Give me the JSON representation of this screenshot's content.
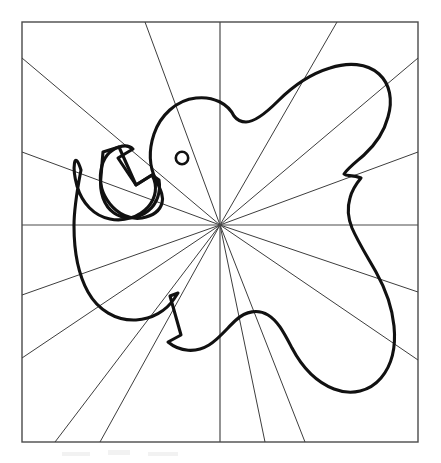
{
  "figure": {
    "medium": "black ink line drawing on white paper",
    "background_color": "#ffffff",
    "outline_color": "#111111",
    "line_color": "#3d3d3d",
    "frame_color": "#4a4a4a",
    "canvas": {
      "width": 441,
      "height": 463
    }
  },
  "frame": {
    "name": "bounding-square",
    "x": 22,
    "y": 22,
    "width": 396,
    "height": 420,
    "stroke_width": 1.4
  },
  "radial_center": {
    "x": 220,
    "y": 225
  },
  "axes": [
    {
      "name": "vertical-axis",
      "x1": 220,
      "y1": 22,
      "x2": 220,
      "y2": 442
    },
    {
      "name": "horizontal-axis",
      "x1": 22,
      "y1": 225,
      "x2": 418,
      "y2": 225
    }
  ],
  "rays": [
    {
      "name": "ray-upper-left-steep",
      "x1": 220,
      "y1": 225,
      "x2": 145,
      "y2": 22
    },
    {
      "name": "ray-upper-left-mid",
      "x1": 220,
      "y1": 225,
      "x2": 22,
      "y2": 58
    },
    {
      "name": "ray-upper-left-shallow",
      "x1": 220,
      "y1": 225,
      "x2": 22,
      "y2": 152
    },
    {
      "name": "ray-upper-right-steep",
      "x1": 220,
      "y1": 225,
      "x2": 337,
      "y2": 22
    },
    {
      "name": "ray-upper-right-mid",
      "x1": 220,
      "y1": 225,
      "x2": 418,
      "y2": 58
    },
    {
      "name": "ray-upper-right-shallow",
      "x1": 220,
      "y1": 225,
      "x2": 418,
      "y2": 152
    },
    {
      "name": "ray-lower-right-shallow",
      "x1": 220,
      "y1": 225,
      "x2": 418,
      "y2": 292
    },
    {
      "name": "ray-lower-right-mid",
      "x1": 220,
      "y1": 225,
      "x2": 418,
      "y2": 360
    },
    {
      "name": "ray-lower-right-steep",
      "x1": 220,
      "y1": 225,
      "x2": 305,
      "y2": 442
    },
    {
      "name": "ray-lower-left-steep",
      "x1": 220,
      "y1": 225,
      "x2": 100,
      "y2": 442
    },
    {
      "name": "ray-lower-left-mid",
      "x1": 220,
      "y1": 225,
      "x2": 22,
      "y2": 358
    },
    {
      "name": "ray-lower-left-shallow",
      "x1": 220,
      "y1": 225,
      "x2": 22,
      "y2": 295
    },
    {
      "name": "ray-lower-left-extra",
      "x1": 220,
      "y1": 225,
      "x2": 55,
      "y2": 442
    },
    {
      "name": "ray-lower-right-extra",
      "x1": 220,
      "y1": 225,
      "x2": 265,
      "y2": 442
    }
  ],
  "subject": {
    "name": "elephant-silhouette",
    "outline_path": "M 234 116 C 228 104 214 96 196 98 C 176 100 160 116 154 134 C 148 152 150 168 156 180 C 160 189 164 196 162 203 C 160 211 152 216 142 218 C 130 220 118 214 110 204 C 102 194 99 182 101 170 C 103 158 110 150 119 147 C 125 145 130 146 133 149 L 118 158 L 136 185 L 152 175 C 158 186 156 198 148 207 C 139 217 124 222 110 219 C 94 216 82 203 77 186 C 72 168 74 148 81 170 C 78 186 74 206 74 226 C 74 250 78 274 88 292 C 98 310 116 321 136 320 C 152 319 166 311 174 299 L 178 293 L 170 296 L 181 335 L 168 342 C 180 352 196 353 209 345 C 220 338 228 327 236 320 C 246 311 258 309 268 315 C 278 321 284 333 292 348 C 302 367 316 382 334 389 C 352 396 370 391 381 378 C 392 365 396 346 394 326 C 392 306 385 288 376 272 C 367 256 358 242 352 228 C 348 218 347 208 350 198 C 352 190 356 184 361 178 C 352 174 347 177 344 174 C 348 168 356 162 364 155 C 375 145 384 132 388 117 C 393 100 390 84 379 74 C 367 63 348 62 330 68 C 310 74 292 87 278 101 C 266 113 254 122 246 122 C 241 122 237 120 234 116 Z",
    "eye": {
      "cx": 182,
      "cy": 158,
      "r": 6.2,
      "stroke_width": 2.6
    }
  },
  "trunk": {
    "name": "curled-trunk",
    "path": "M 103 152 L 101 176 C 99 192 104 206 114 213 C 124 220 138 219 148 211 C 157 204 161 192 159 180 L 152 175 L 136 185 L 119 147 Z"
  },
  "smudges": [
    {
      "x": 62,
      "y": 452,
      "w": 28,
      "h": 4
    },
    {
      "x": 108,
      "y": 450,
      "w": 22,
      "h": 5
    },
    {
      "x": 148,
      "y": 452,
      "w": 30,
      "h": 4
    }
  ]
}
